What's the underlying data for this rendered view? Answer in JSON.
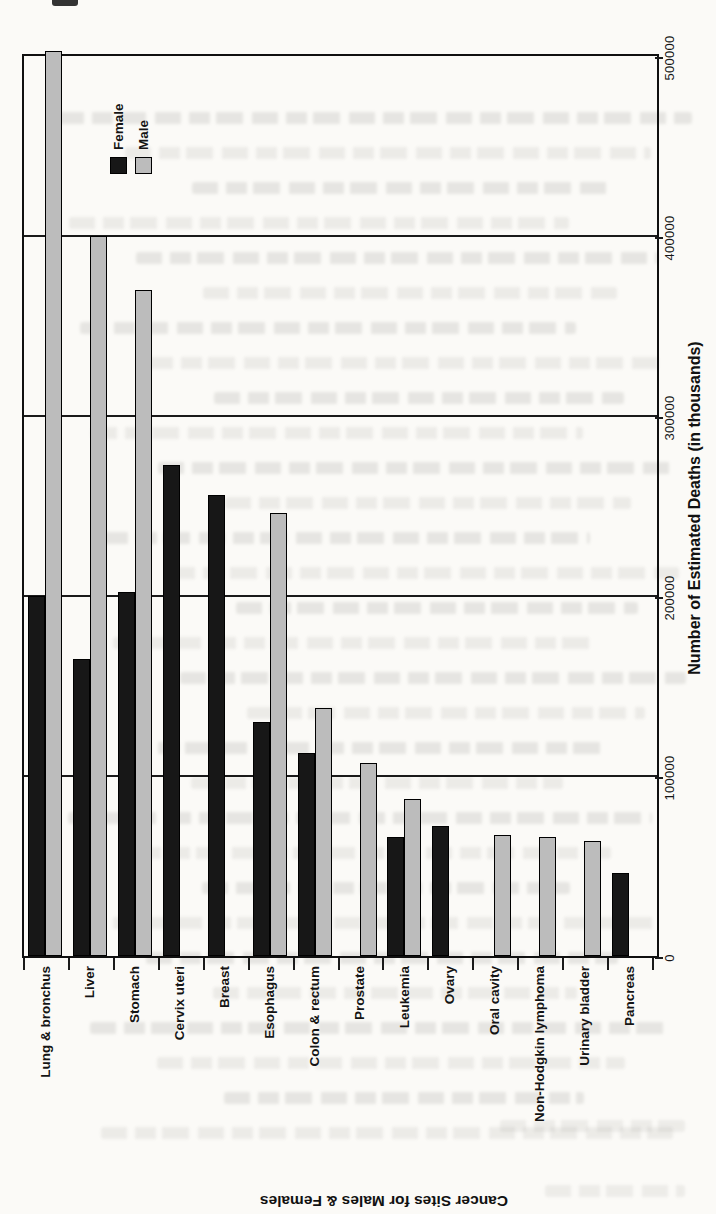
{
  "chart_data": {
    "type": "bar",
    "orientation": "horizontal bars, figure printed rotated 90 degrees on portrait page",
    "title_category_axis": "Cancer Sites for Males & Females",
    "title_value_axis": "Number of Estimated Deaths (in thousands)",
    "legend": [
      "Female",
      "Male"
    ],
    "legend_colors": {
      "female": "#171717",
      "male": "#bcbcbc"
    },
    "categories": [
      "Lung & bronchus",
      "Liver",
      "Stomach",
      "Cervix uteri",
      "Breast",
      "Esophagus",
      "Colon & rectum",
      "Prostate",
      "Leukemia",
      "Ovary",
      "Oral cavity",
      "Non-Hodgkin lymphoma",
      "Urinary bladder",
      "Pancreas"
    ],
    "series": [
      {
        "name": "Female",
        "color": "#171717",
        "values": [
          200000,
          165000,
          202000,
          273000,
          256000,
          130000,
          113000,
          null,
          66000,
          72000,
          null,
          null,
          null,
          46000
        ]
      },
      {
        "name": "Male",
        "color": "#bcbcbc",
        "values": [
          503000,
          400000,
          370000,
          null,
          null,
          246000,
          138000,
          107000,
          87000,
          null,
          67000,
          66000,
          64000,
          null
        ]
      }
    ],
    "value_axis": {
      "min": 0,
      "max": 500000,
      "tick_step": 100000,
      "tick_labels": [
        "0",
        "100000",
        "200000",
        "300000",
        "400000",
        "500000"
      ],
      "grid": true
    }
  }
}
